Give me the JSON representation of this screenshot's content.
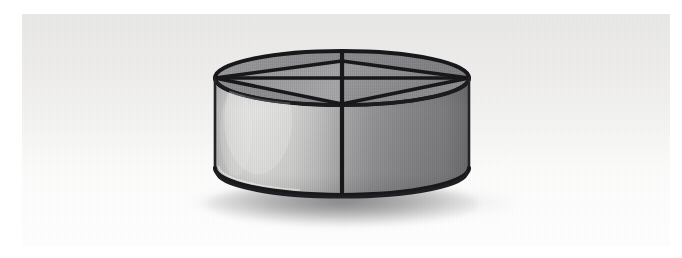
{
  "scene": {
    "title": "Cylindrical mesh divider",
    "subject": "shallow cylindrical wire-frame bin with mesh panels and radial dividers",
    "view": "three-quarter elevated perspective",
    "background_label": "seamless light gray studio backdrop",
    "lighting": "soft key light from upper left, falloff to the right",
    "shadow_label": "soft contact shadow beneath base"
  },
  "canvas": {
    "width": 682,
    "height": 258,
    "page_background": "#ffffff",
    "plate": {
      "x": 22,
      "y": 14,
      "width": 648,
      "height": 232
    }
  },
  "colors": {
    "page_white": "#ffffff",
    "backdrop_top": "#e8e8e6",
    "backdrop_mid": "#f4f4f3",
    "backdrop_bottom": "#fefefe",
    "frame_dark": "#17171a",
    "frame_dark_soft": "#2a2a2e",
    "mesh_light": "#cfcfcf",
    "mesh_mid": "#a9a9ab",
    "mesh_dark": "#8a8a8d",
    "mesh_darkest": "#6f6f72",
    "top_panel_light": "#a3a3a6",
    "top_panel_dark": "#8c8c90",
    "highlight": "#f0f0ef",
    "shadow_tone": "#5c5c5e"
  },
  "geometry": {
    "ellipse_top": {
      "cx": 342,
      "cy": 78,
      "rx": 127,
      "ry": 27
    },
    "ellipse_bottom": {
      "cx": 342,
      "cy": 168,
      "rx": 127,
      "ry": 27
    },
    "wall_height": 90,
    "left_extent": 215,
    "right_extent": 469,
    "top_extent": 51,
    "bottom_extent": 196
  },
  "parts": [
    {
      "id": "top-rim",
      "label": "Top rim ellipse"
    },
    {
      "id": "bottom-rim",
      "label": "Bottom rim ellipse"
    },
    {
      "id": "center-spine",
      "label": "Center vertical divider"
    },
    {
      "id": "left-diagonal",
      "label": "Left diagonal brace"
    },
    {
      "id": "right-diagonal",
      "label": "Right diagonal brace"
    },
    {
      "id": "rear-crossbar",
      "label": "Rear horizontal crossbar"
    },
    {
      "id": "left-wall-panel",
      "label": "Left mesh wall panel"
    },
    {
      "id": "right-wall-panel",
      "label": "Right mesh wall panel"
    },
    {
      "id": "interior-floor",
      "label": "Interior mesh floor"
    }
  ]
}
